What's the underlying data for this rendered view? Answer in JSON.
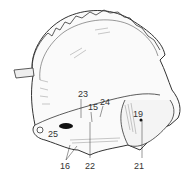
{
  "figure": {
    "labels": [
      {
        "id": "23",
        "text": "23",
        "x": 78,
        "y": 90
      },
      {
        "id": "15",
        "text": "15",
        "x": 88,
        "y": 103
      },
      {
        "id": "24",
        "text": "24",
        "x": 100,
        "y": 98
      },
      {
        "id": "19",
        "text": "19",
        "x": 133,
        "y": 110
      },
      {
        "id": "25",
        "text": "25",
        "x": 48,
        "y": 130
      },
      {
        "id": "16",
        "text": "16",
        "x": 60,
        "y": 162
      },
      {
        "id": "22",
        "text": "22",
        "x": 85,
        "y": 162
      },
      {
        "id": "21",
        "text": "21",
        "x": 134,
        "y": 162
      }
    ],
    "colors": {
      "ink": "#333333",
      "background": "#ffffff"
    }
  }
}
